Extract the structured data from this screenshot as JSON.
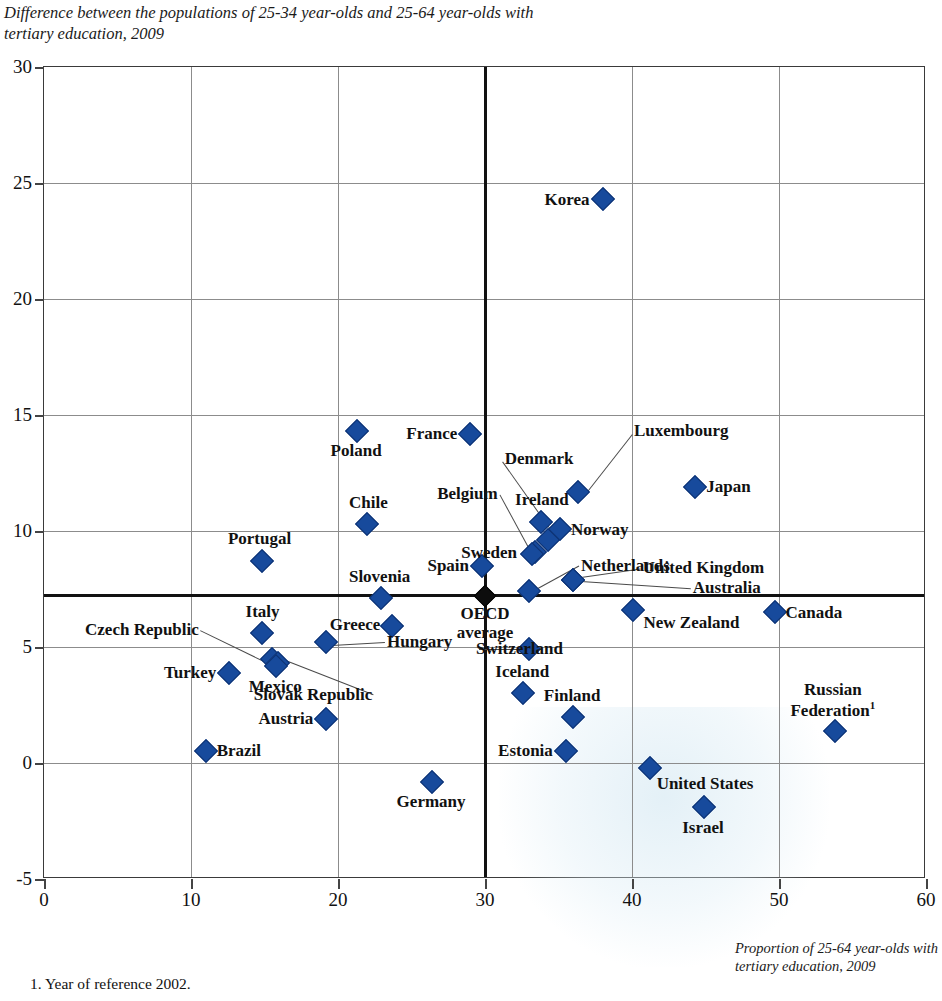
{
  "title": "Difference between the populations of 25-34 year-olds and 25-64 year-olds with tertiary education, 2009",
  "xaxis_caption": "Proportion of 25-64 year-olds with tertiary education, 2009",
  "footnote": "1. Year of reference 2002.",
  "chart_data": {
    "type": "scatter",
    "title": "Difference between the populations of 25-34 year-olds and 25-64 year-olds with tertiary education, 2009",
    "xlabel": "Proportion of 25-64 year-olds with tertiary education, 2009",
    "ylabel": "Difference between the populations of 25-34 year-olds and 25-64 year-olds with tertiary education, 2009",
    "xlim": [
      0,
      60
    ],
    "ylim": [
      -5,
      30
    ],
    "xticks": [
      0,
      10,
      20,
      30,
      40,
      50,
      60
    ],
    "yticks": [
      -5,
      0,
      5,
      10,
      15,
      20,
      25,
      30
    ],
    "grid": true,
    "legend": "none",
    "reference_lines": {
      "oecd_average_x": 30,
      "oecd_average_y": 7.2,
      "label": "OECD average"
    },
    "points": [
      {
        "name": "Korea",
        "x": 38.0,
        "y": 24.3,
        "label_pos": "left"
      },
      {
        "name": "France",
        "x": 29.0,
        "y": 14.2,
        "label_pos": "left"
      },
      {
        "name": "Poland",
        "x": 21.3,
        "y": 14.3,
        "label_pos": "below"
      },
      {
        "name": "Japan",
        "x": 44.3,
        "y": 11.9,
        "label_pos": "right"
      },
      {
        "name": "Luxembourg",
        "x": 36.3,
        "y": 11.7,
        "label_pos": "leader"
      },
      {
        "name": "Ireland",
        "x": 33.8,
        "y": 10.4,
        "label_pos": "above"
      },
      {
        "name": "Chile",
        "x": 22.0,
        "y": 10.3,
        "label_pos": "above"
      },
      {
        "name": "Norway",
        "x": 35.1,
        "y": 10.1,
        "label_pos": "right"
      },
      {
        "name": "Denmark",
        "x": 34.3,
        "y": 9.6,
        "label_pos": "leader"
      },
      {
        "name": "Belgium",
        "x": 33.4,
        "y": 9.1,
        "label_pos": "leader"
      },
      {
        "name": "Sweden",
        "x": 33.2,
        "y": 9.0,
        "label_pos": "left"
      },
      {
        "name": "Portugal",
        "x": 14.8,
        "y": 8.7,
        "label_pos": "above"
      },
      {
        "name": "Spain",
        "x": 29.8,
        "y": 8.5,
        "label_pos": "left"
      },
      {
        "name": "Netherlands",
        "x": 33.0,
        "y": 7.4,
        "label_pos": "leader"
      },
      {
        "name": "United Kingdom",
        "x": 36.0,
        "y": 7.9,
        "label_pos": "leader"
      },
      {
        "name": "Australia",
        "x": 36.0,
        "y": 7.9,
        "label_pos": "leader"
      },
      {
        "name": "Slovenia",
        "x": 22.9,
        "y": 7.1,
        "label_pos": "above"
      },
      {
        "name": "Canada",
        "x": 49.7,
        "y": 6.5,
        "label_pos": "right"
      },
      {
        "name": "New Zealand",
        "x": 40.1,
        "y": 6.6,
        "label_pos": "right"
      },
      {
        "name": "Greece",
        "x": 23.7,
        "y": 5.9,
        "label_pos": "left"
      },
      {
        "name": "Italy",
        "x": 14.8,
        "y": 5.6,
        "label_pos": "above"
      },
      {
        "name": "Hungary",
        "x": 19.2,
        "y": 5.2,
        "label_pos": "below"
      },
      {
        "name": "Switzerland",
        "x": 33.0,
        "y": 4.9,
        "label_pos": "right"
      },
      {
        "name": "Czech Republic",
        "x": 15.5,
        "y": 4.5,
        "label_pos": "leader"
      },
      {
        "name": "Slovak Republic",
        "x": 15.9,
        "y": 4.3,
        "label_pos": "leader"
      },
      {
        "name": "Mexico",
        "x": 15.8,
        "y": 4.2,
        "label_pos": "below"
      },
      {
        "name": "Turkey",
        "x": 12.6,
        "y": 3.9,
        "label_pos": "left"
      },
      {
        "name": "Iceland",
        "x": 32.6,
        "y": 3.0,
        "label_pos": "above"
      },
      {
        "name": "Finland",
        "x": 36.0,
        "y": 2.0,
        "label_pos": "above"
      },
      {
        "name": "Austria",
        "x": 19.2,
        "y": 1.9,
        "label_pos": "left"
      },
      {
        "name": "Russian Federation",
        "x": 53.8,
        "y": 1.4,
        "label_pos": "above",
        "footnote": "1"
      },
      {
        "name": "Brazil",
        "x": 11.0,
        "y": 0.5,
        "label_pos": "right"
      },
      {
        "name": "Estonia",
        "x": 35.5,
        "y": 0.5,
        "label_pos": "left"
      },
      {
        "name": "United States",
        "x": 41.2,
        "y": -0.2,
        "label_pos": "below-right"
      },
      {
        "name": "Germany",
        "x": 26.4,
        "y": -0.8,
        "label_pos": "below"
      },
      {
        "name": "Israel",
        "x": 44.9,
        "y": -1.9,
        "label_pos": "below"
      }
    ]
  },
  "labels": {
    "korea": "Korea",
    "france": "France",
    "poland": "Poland",
    "japan": "Japan",
    "luxembourg": "Luxembourg",
    "ireland": "Ireland",
    "chile": "Chile",
    "norway": "Norway",
    "denmark": "Denmark",
    "belgium": "Belgium",
    "sweden": "Sweden",
    "portugal": "Portugal",
    "spain": "Spain",
    "netherlands": "Netherlands",
    "united_kingdom": "United Kingdom",
    "australia": "Australia",
    "slovenia": "Slovenia",
    "canada": "Canada",
    "new_zealand": "New Zealand",
    "greece": "Greece",
    "italy": "Italy",
    "hungary": "Hungary",
    "switzerland": "Switzerland",
    "czech_republic": "Czech Republic",
    "slovak_republic": "Slovak Republic",
    "mexico": "Mexico",
    "turkey": "Turkey",
    "iceland": "Iceland",
    "finland": "Finland",
    "austria": "Austria",
    "russian_federation_line1": "Russian",
    "russian_federation_line2": "Federation",
    "russian_footnote": "1",
    "brazil": "Brazil",
    "estonia": "Estonia",
    "united_states": "United States",
    "germany": "Germany",
    "israel": "Israel",
    "oecd_line1": "OECD",
    "oecd_line2": "average"
  },
  "colors": {
    "marker": "#174a9c",
    "oecd_marker": "#0d0d0d",
    "grid": "#8c8c8c",
    "axis": "#111111"
  }
}
